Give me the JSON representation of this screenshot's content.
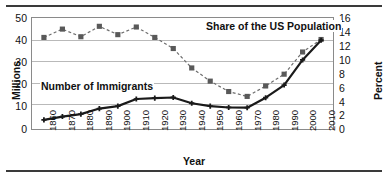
{
  "axes": {
    "left_title": "Millions",
    "right_title": "Percent",
    "x_title": "Year",
    "left_ticks": [
      "50",
      "40",
      "30",
      "20",
      "10",
      "0"
    ],
    "right_ticks": [
      "16",
      "14",
      "12",
      "10",
      "8",
      "6",
      "4",
      "2",
      "0"
    ],
    "x_ticks": [
      "1860",
      "1870",
      "1880",
      "1890",
      "1900",
      "1910",
      "1920",
      "1930",
      "1940",
      "1950",
      "1960",
      "1970",
      "1980",
      "1990",
      "2000",
      "2010"
    ]
  },
  "labels": {
    "share_series": "Share of the US Population",
    "immigrants_series": "Number of Immigrants"
  },
  "colors": {
    "share_marker": "#595959",
    "share_line": "#6e6e6e",
    "immigrants_line": "#1a1a1a",
    "grid": "#b9b9b9",
    "axis": "#8a8a8a",
    "rule": "#3a3a3a"
  },
  "chart_data": {
    "type": "line",
    "title": "",
    "xlabel": "Year",
    "categories": [
      "1860",
      "1870",
      "1880",
      "1890",
      "1900",
      "1910",
      "1920",
      "1930",
      "1940",
      "1950",
      "1960",
      "1970",
      "1980",
      "1990",
      "2000",
      "2010"
    ],
    "grid": true,
    "legend_position": "inline-annotation",
    "series": [
      {
        "name": "Number of Immigrants",
        "axis": "left",
        "ylabel": "Millions",
        "ylim": [
          0,
          50
        ],
        "ytick_step": 10,
        "style": "solid-line-with-plus-markers",
        "values": [
          4.1,
          5.6,
          6.7,
          9.2,
          10.3,
          13.5,
          13.9,
          14.2,
          11.6,
          10.3,
          9.7,
          9.6,
          14.1,
          19.8,
          31.1,
          40.0
        ]
      },
      {
        "name": "Share of the US Population",
        "axis": "right",
        "ylabel": "Percent",
        "ylim": [
          0,
          16
        ],
        "ytick_step": 2,
        "style": "dashed-line-with-square-markers",
        "values": [
          13.2,
          14.4,
          13.3,
          14.8,
          13.6,
          14.7,
          13.2,
          11.6,
          8.8,
          6.9,
          5.4,
          4.7,
          6.2,
          7.9,
          11.1,
          12.9
        ]
      }
    ]
  }
}
